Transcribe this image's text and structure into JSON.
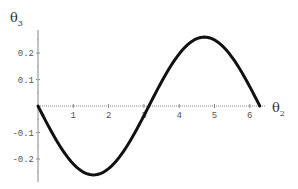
{
  "chart_data": {
    "type": "line",
    "title": "",
    "xlabel": "θ2",
    "ylabel": "θ3",
    "xlim": [
      0,
      6.5
    ],
    "ylim": [
      -0.27,
      0.27
    ],
    "xticks": [
      1,
      2,
      3,
      4,
      5,
      6
    ],
    "yticks": [
      -0.2,
      -0.1,
      0.1,
      0.2
    ],
    "xtick_labels": [
      "1",
      "2",
      "3",
      "4",
      "5",
      "6"
    ],
    "ytick_labels": [
      "-0.2",
      "-0.1",
      "0.1",
      "0.2"
    ],
    "grid": false,
    "legend": null,
    "series": [
      {
        "name": "θ3(θ2)",
        "description": "approximately -0.26·sin(θ2) over [0, 2π]",
        "x": [
          0,
          0.5,
          1.0,
          1.57,
          2.0,
          2.5,
          3.14,
          3.5,
          4.0,
          4.71,
          5.0,
          5.5,
          6.28
        ],
        "y": [
          0,
          -0.125,
          -0.219,
          -0.26,
          -0.236,
          -0.156,
          0,
          0.091,
          0.197,
          0.26,
          0.249,
          0.183,
          0
        ]
      }
    ]
  },
  "labels": {
    "x_main": "θ",
    "x_sub": "2",
    "y_main": "θ",
    "y_sub": "3"
  }
}
